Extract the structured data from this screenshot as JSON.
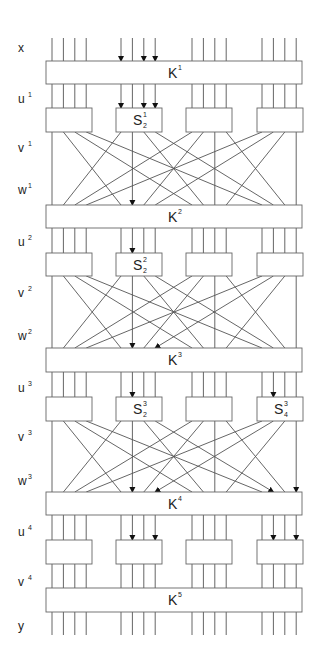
{
  "diagram": {
    "labels": [
      {
        "name": "x",
        "sup": ""
      },
      {
        "name": "u",
        "sup": "1"
      },
      {
        "name": "v",
        "sup": "1"
      },
      {
        "name": "w",
        "sup": "1"
      },
      {
        "name": "u",
        "sup": "2"
      },
      {
        "name": "v",
        "sup": "2"
      },
      {
        "name": "w",
        "sup": "2"
      },
      {
        "name": "u",
        "sup": "3"
      },
      {
        "name": "v",
        "sup": "3"
      },
      {
        "name": "w",
        "sup": "3"
      },
      {
        "name": "u",
        "sup": "4"
      },
      {
        "name": "v",
        "sup": "4"
      },
      {
        "name": "y",
        "sup": ""
      }
    ],
    "key_boxes": [
      {
        "label": "K",
        "sup": "1"
      },
      {
        "label": "K",
        "sup": "2"
      },
      {
        "label": "K",
        "sup": "3"
      },
      {
        "label": "K",
        "sup": "4"
      },
      {
        "label": "K",
        "sup": "5"
      }
    ],
    "sbox_layers": [
      {
        "round": 1,
        "active": [
          {
            "box": 1,
            "label": "S",
            "sup": "1",
            "sub": "2"
          }
        ],
        "input_arrows": [
          [
            1,
            0
          ],
          [
            1,
            2
          ],
          [
            1,
            3
          ]
        ]
      },
      {
        "round": 2,
        "active": [
          {
            "box": 1,
            "label": "S",
            "sup": "2",
            "sub": "2"
          }
        ],
        "input_arrows": [
          [
            1,
            1
          ]
        ]
      },
      {
        "round": 3,
        "active": [
          {
            "box": 1,
            "label": "S",
            "sup": "3",
            "sub": "2"
          },
          {
            "box": 3,
            "label": "S",
            "sup": "3",
            "sub": "4"
          }
        ],
        "input_arrows": [
          [
            1,
            1
          ],
          [
            3,
            1
          ]
        ]
      },
      {
        "round": 4,
        "active": [],
        "input_arrows": [
          [
            1,
            1
          ],
          [
            1,
            3
          ],
          [
            3,
            1
          ],
          [
            3,
            3
          ]
        ]
      }
    ],
    "plaintext_arrows": [
      [
        1,
        0
      ],
      [
        1,
        2
      ],
      [
        1,
        3
      ]
    ],
    "permutation_arrows": [
      {
        "round": 1,
        "bits": [
          [
            1,
            1
          ]
        ]
      },
      {
        "round": 2,
        "bits": [
          [
            1,
            1
          ],
          [
            1,
            3
          ]
        ]
      },
      {
        "round": 3,
        "bits": [
          [
            1,
            1
          ],
          [
            1,
            3
          ],
          [
            3,
            1
          ],
          [
            3,
            3
          ]
        ]
      }
    ],
    "num_sboxes": 4,
    "bits_per_sbox": 4
  }
}
